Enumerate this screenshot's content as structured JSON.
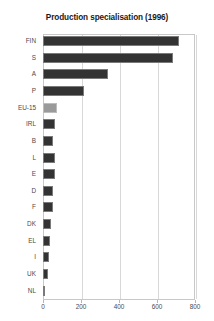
{
  "chart_data": {
    "type": "bar",
    "orientation": "horizontal",
    "title": "Production specialisation (1996)",
    "xlabel": "",
    "ylabel": "",
    "xlim": [
      0,
      800
    ],
    "ylim": null,
    "grid": true,
    "legend": null,
    "xticks": [
      0,
      200,
      400,
      600,
      800
    ],
    "xtick_labels": [
      "0",
      "200",
      "400",
      "600",
      "800"
    ],
    "categories": [
      "FIN",
      "S",
      "A",
      "P",
      "EU-15",
      "IRL",
      "B",
      "L",
      "E",
      "D",
      "F",
      "DK",
      "EL",
      "I",
      "UK",
      "NL"
    ],
    "values": [
      715,
      685,
      340,
      215,
      75,
      62,
      55,
      65,
      65,
      54,
      53,
      44,
      38,
      33,
      28,
      10
    ],
    "highlight_category": "EU-15",
    "colors": {
      "bar": "#333333",
      "bar_highlight": "#9a9a9a",
      "grid": "#d8d8d8",
      "axis": "#c8c8c8",
      "text": "#4a4a4a",
      "title": "#1a1a1a",
      "background": "#ffffff"
    }
  }
}
